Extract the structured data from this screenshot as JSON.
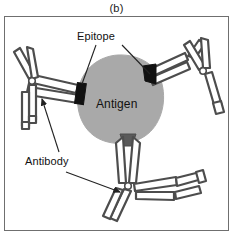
{
  "figure": {
    "panel_caption": "(b)",
    "diagram_type": "antigen-antibody complex schematic",
    "background_color": "#ffffff",
    "frame": {
      "border_color": "#6f6f6f",
      "fill_color": "#ffffff"
    }
  },
  "labels": {
    "epitope": "Epitope",
    "antibody": "Antibody",
    "antigen": "Antigen"
  },
  "colors": {
    "antigen_fill": "#a9a9a9",
    "antigen_stroke": "#a9a9a9",
    "antibody_stroke": "#4d4d4d",
    "antibody_fill": "#ffffff",
    "epitope_fill": "#111111",
    "leader_line": "#222222",
    "text": "#111111"
  },
  "elements": {
    "antigen": {
      "name": "Antigen",
      "shape": "irregular rounded blob",
      "center": [
        120,
        95
      ],
      "approx_radius": 40
    },
    "epitopes": [
      {
        "id": "epitope-left",
        "position": [
          82,
          92
        ],
        "bound": true
      },
      {
        "id": "epitope-right",
        "position": [
          150,
          72
        ],
        "bound": true
      },
      {
        "id": "epitope-bottom",
        "position": [
          128,
          137
        ],
        "bound": true
      }
    ],
    "antibodies": [
      {
        "id": "antibody-left-bound",
        "position": "left",
        "bound_to": "epitope-left"
      },
      {
        "id": "antibody-left-free",
        "position": "far-left",
        "bound_to": null
      },
      {
        "id": "antibody-right-bound",
        "position": "right",
        "bound_to": "epitope-right"
      },
      {
        "id": "antibody-right-free",
        "position": "far-right",
        "bound_to": null
      },
      {
        "id": "antibody-bottom-bound",
        "position": "bottom",
        "bound_to": "epitope-bottom"
      },
      {
        "id": "antibody-bottom-free",
        "position": "bottom-right",
        "bound_to": null
      }
    ],
    "leaders": [
      {
        "id": "epitope-leader-left",
        "from_label": "epitope",
        "to": "epitope-left"
      },
      {
        "id": "epitope-leader-right",
        "from_label": "epitope",
        "to": "epitope-right"
      },
      {
        "id": "antibody-leader-up",
        "from_label": "antibody",
        "to": "antibody-left-bound"
      },
      {
        "id": "antibody-leader-down",
        "from_label": "antibody",
        "to": "antibody-bottom-free",
        "arrow": true
      }
    ]
  }
}
